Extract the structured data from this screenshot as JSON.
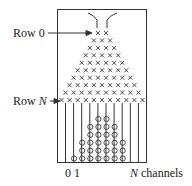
{
  "labels": {
    "row0": "Row 0",
    "rowN_prefix": "Row ",
    "rowN_var": "N",
    "channel_0": "0",
    "channel_1": "1",
    "channels_var": "N",
    "channels_suffix": " channels"
  },
  "galton_board": {
    "peg_rows": [
      2,
      3,
      4,
      5,
      6,
      7,
      8,
      9,
      10,
      11
    ],
    "peg_symbol": "×",
    "num_channels": 11,
    "ball_counts_by_channel": [
      0,
      1,
      3,
      5,
      6,
      6,
      5,
      3,
      0,
      0,
      0
    ],
    "ball_symbol": "○"
  },
  "colors": {
    "ink": "#333333",
    "background": "#ffffff"
  }
}
